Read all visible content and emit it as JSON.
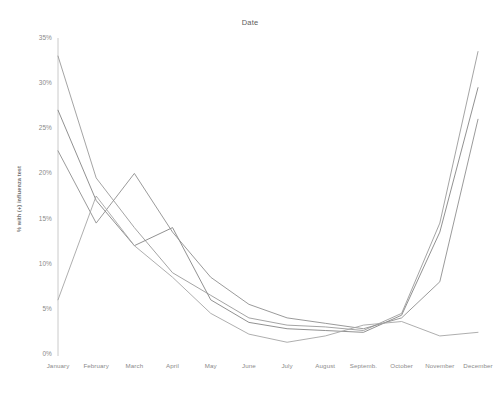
{
  "chart_data": {
    "type": "line",
    "title": "Date",
    "xlabel": "",
    "ylabel": "% with (+) influenza test",
    "categories": [
      "January",
      "February",
      "March",
      "April",
      "May",
      "June",
      "July",
      "August",
      "Septemb.",
      "October",
      "November",
      "December"
    ],
    "xtick_labels": [
      "January",
      "February",
      "March",
      "April",
      "May",
      "June",
      "July",
      "August",
      "Septemb.",
      "October",
      "November",
      "December"
    ],
    "ytick_labels": [
      "35%",
      "30%",
      "25%",
      "20%",
      "15%",
      "10%",
      "5%",
      "0%"
    ],
    "ytick_values": [
      35,
      30,
      25,
      20,
      15,
      10,
      5,
      0
    ],
    "ylim": [
      0,
      35
    ],
    "grid": false,
    "legend": "none",
    "series": [
      {
        "name": "series-1",
        "color": "#9a9a9a",
        "values": [
          33.0,
          19.5,
          14.0,
          9.0,
          6.5,
          4.0,
          3.2,
          3.0,
          2.6,
          4.5,
          14.5,
          33.5
        ]
      },
      {
        "name": "series-2",
        "color": "#858585",
        "values": [
          27.0,
          17.0,
          12.0,
          14.0,
          6.0,
          3.5,
          2.8,
          2.6,
          2.4,
          4.3,
          13.5,
          29.5
        ]
      },
      {
        "name": "series-3",
        "color": "#8f8f8f",
        "values": [
          22.5,
          14.5,
          20.0,
          13.5,
          8.5,
          5.5,
          4.0,
          3.4,
          2.8,
          4.0,
          8.0,
          26.0
        ]
      },
      {
        "name": "series-4",
        "color": "#a5a5a5",
        "values": [
          6.0,
          17.5,
          12.0,
          8.5,
          4.5,
          2.2,
          1.3,
          2.0,
          3.2,
          3.6,
          2.0,
          2.4
        ]
      }
    ]
  },
  "axes": {
    "y_axis_title": "% with (+) influenza test"
  }
}
